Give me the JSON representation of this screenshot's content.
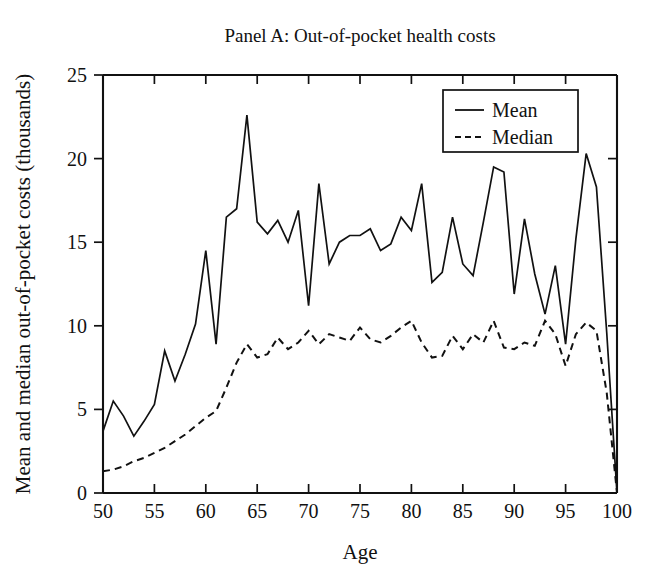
{
  "chart_data": {
    "type": "line",
    "title": "Panel A: Out-of-pocket health costs",
    "xlabel": "Age",
    "ylabel": "Mean and median out-of-pocket costs (thousands)",
    "xlim": [
      50,
      100
    ],
    "ylim": [
      0,
      25
    ],
    "xticks": [
      50,
      55,
      60,
      65,
      70,
      75,
      80,
      85,
      90,
      95,
      100
    ],
    "yticks": [
      0,
      5,
      10,
      15,
      20,
      25
    ],
    "xtick_labels": [
      "50",
      "55",
      "60",
      "65",
      "70",
      "75",
      "80",
      "85",
      "90",
      "95",
      "100"
    ],
    "ytick_labels": [
      "0",
      "5",
      "10",
      "15",
      "20",
      "25"
    ],
    "grid": false,
    "legend_position": "top-right",
    "x": [
      50,
      51,
      52,
      53,
      54,
      55,
      56,
      57,
      58,
      59,
      60,
      61,
      62,
      63,
      64,
      65,
      66,
      67,
      68,
      69,
      70,
      71,
      72,
      73,
      74,
      75,
      76,
      77,
      78,
      79,
      80,
      81,
      82,
      83,
      84,
      85,
      86,
      87,
      88,
      89,
      90,
      91,
      92,
      93,
      94,
      95,
      96,
      97,
      98,
      99,
      100
    ],
    "series": [
      {
        "name": "Mean",
        "style": "solid",
        "color": "#111111",
        "values": [
          3.7,
          5.5,
          4.6,
          3.4,
          4.3,
          5.3,
          8.5,
          6.7,
          8.3,
          10.1,
          14.5,
          8.9,
          16.5,
          17.0,
          22.6,
          16.2,
          15.5,
          16.3,
          15.0,
          16.9,
          11.2,
          18.5,
          13.7,
          15.0,
          15.4,
          15.4,
          15.8,
          14.5,
          14.9,
          16.5,
          15.7,
          18.5,
          12.6,
          13.2,
          16.5,
          13.7,
          13.0,
          16.2,
          19.5,
          19.2,
          11.9,
          16.4,
          13.1,
          10.7,
          13.6,
          8.9,
          15.2,
          20.3,
          18.3,
          9.6,
          0.0
        ]
      },
      {
        "name": "Median",
        "style": "dashed",
        "color": "#111111",
        "values": [
          1.3,
          1.4,
          1.6,
          1.9,
          2.1,
          2.4,
          2.7,
          3.1,
          3.5,
          4.0,
          4.5,
          4.9,
          6.3,
          7.8,
          8.9,
          8.1,
          8.3,
          9.3,
          8.6,
          9.0,
          9.7,
          8.9,
          9.5,
          9.3,
          9.1,
          9.9,
          9.2,
          9.0,
          9.4,
          9.9,
          10.3,
          9.0,
          8.1,
          8.2,
          9.4,
          8.6,
          9.5,
          9.0,
          10.3,
          8.7,
          8.6,
          9.0,
          8.8,
          10.3,
          9.5,
          7.6,
          9.5,
          10.2,
          9.7,
          6.0,
          0.0
        ]
      }
    ],
    "legend": [
      {
        "label": "Mean",
        "style": "solid"
      },
      {
        "label": "Median",
        "style": "dashed"
      }
    ]
  },
  "plot_geometry": {
    "left": 103,
    "right": 617,
    "top": 75,
    "bottom": 493
  }
}
